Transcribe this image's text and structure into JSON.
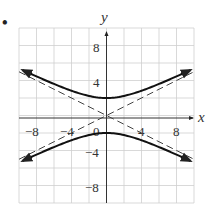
{
  "chart_data": {
    "type": "line",
    "title": "",
    "xlabel": "x",
    "ylabel": "y",
    "xlim": [
      -10,
      10
    ],
    "ylim": [
      -10,
      10
    ],
    "grid": true,
    "grid_step": 2,
    "x_ticks": [
      "−8",
      "−4",
      "0",
      "4",
      "8"
    ],
    "y_ticks": [
      "8",
      "4",
      "−4",
      "−8"
    ],
    "series": [
      {
        "name": "hyperbola upper branch",
        "style": "solid",
        "equation": "y^2/4 - x^2/16 = 1, y > 0",
        "vertex": [
          0,
          2
        ]
      },
      {
        "name": "hyperbola lower branch",
        "style": "solid",
        "equation": "y^2/4 - x^2/16 = 1, y < 0",
        "vertex": [
          0,
          -2
        ]
      },
      {
        "name": "asymptote",
        "style": "dashed",
        "equation": "y = x/2"
      },
      {
        "name": "asymptote",
        "style": "dashed",
        "equation": "y = -x/2"
      }
    ],
    "legend": null
  },
  "labels": {
    "x_axis": "x",
    "y_axis": "y",
    "bullet": "•",
    "tick_x": [
      "−8",
      "−4",
      "0",
      "4",
      "8"
    ],
    "tick_y": [
      "8",
      "4",
      "−4",
      "−8"
    ]
  }
}
